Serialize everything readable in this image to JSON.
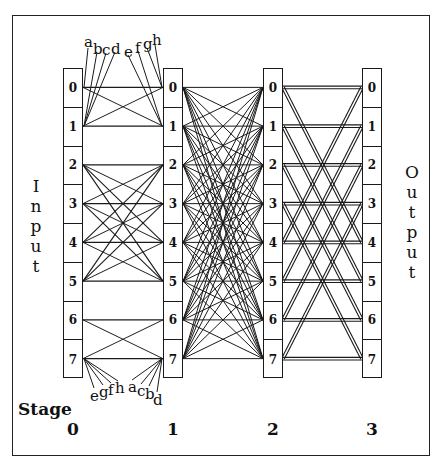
{
  "diagram": {
    "title": "",
    "input_label": "Input",
    "output_label": "Output",
    "stage_label": "Stage",
    "stages": [
      "0",
      "1",
      "2",
      "3"
    ],
    "node_labels": [
      "0",
      "1",
      "2",
      "3",
      "4",
      "5",
      "6",
      "7"
    ],
    "top_labels_left": [
      "a",
      "b",
      "c",
      "d"
    ],
    "top_labels_right": [
      "e",
      "f",
      "g",
      "h"
    ],
    "bottom_labels_left": [
      "e",
      "g",
      "f",
      "h"
    ],
    "bottom_labels_right": [
      "a",
      "c",
      "b",
      "d"
    ],
    "connections": {
      "stage0_to_1": "blocks {0,1},{2,3,4,5},{6,7} fully connected",
      "stage1_to_2": "complete 8x8 bipartite",
      "stage2_to_3": "double links i->i and i<->i+4"
    },
    "colors": {
      "line": "#1a1a1a",
      "background": "#ffffff"
    }
  }
}
